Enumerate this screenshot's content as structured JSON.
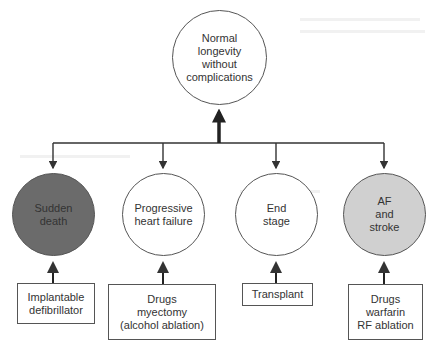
{
  "diagram": {
    "top_node": {
      "label": "Normal\nlongevity\nwithout\ncomplications"
    },
    "outcomes": [
      {
        "id": "sudden-death",
        "label": "Sudden\ndeath",
        "fill": "#6b6b6b"
      },
      {
        "id": "progressive-heart-failure",
        "label": "Progressive\nheart failure",
        "fill": "#ffffff"
      },
      {
        "id": "end-stage",
        "label": "End\nstage",
        "fill": "#ffffff"
      },
      {
        "id": "af-and-stroke",
        "label": "AF\nand\nstroke",
        "fill": "#d0d0d0"
      }
    ],
    "treatments": [
      {
        "for": "sudden-death",
        "label": "Implantable\ndefibrillator"
      },
      {
        "for": "progressive-heart-failure",
        "label": "Drugs\nmyectomy\n(alcohol ablation)"
      },
      {
        "for": "end-stage",
        "label": "Transplant"
      },
      {
        "for": "af-and-stroke",
        "label": "Drugs\nwarfarin\nRF ablation"
      }
    ],
    "colors": {
      "line": "#333333",
      "border": "#555555"
    }
  }
}
